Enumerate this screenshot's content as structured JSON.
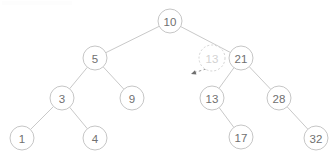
{
  "diagram": {
    "type": "binary-search-tree",
    "colors": {
      "background": "#ffffff",
      "node_stroke": "#c6c6c6",
      "node_fill": "#ffffff",
      "label_text": "#707070",
      "edge_stroke": "#c9c9c9",
      "ghost_stroke": "#d4d4d4",
      "ghost_text": "#d2d2d2",
      "arrow_stroke": "#9a9a9a"
    },
    "node_radius": 12,
    "ghost_node_radius": 13,
    "nodes": [
      {
        "id": "n10",
        "label": "10",
        "x": 170,
        "y": 21,
        "ghost": false
      },
      {
        "id": "n5",
        "label": "5",
        "x": 95,
        "y": 58,
        "ghost": false
      },
      {
        "id": "n21",
        "label": "21",
        "x": 241,
        "y": 58,
        "ghost": false
      },
      {
        "id": "n3",
        "label": "3",
        "x": 62,
        "y": 98,
        "ghost": false
      },
      {
        "id": "n9",
        "label": "9",
        "x": 132,
        "y": 98,
        "ghost": false
      },
      {
        "id": "n13",
        "label": "13",
        "x": 212,
        "y": 98,
        "ghost": false
      },
      {
        "id": "n28",
        "label": "28",
        "x": 279,
        "y": 98,
        "ghost": false
      },
      {
        "id": "n1",
        "label": "1",
        "x": 22,
        "y": 138,
        "ghost": false
      },
      {
        "id": "n4",
        "label": "4",
        "x": 95,
        "y": 138,
        "ghost": false
      },
      {
        "id": "n17",
        "label": "17",
        "x": 241,
        "y": 137,
        "ghost": false
      },
      {
        "id": "n32",
        "label": "32",
        "x": 316,
        "y": 138,
        "ghost": false
      },
      {
        "id": "nghost13",
        "label": "13",
        "x": 212,
        "y": 58,
        "ghost": true
      }
    ],
    "edges": [
      {
        "from": "n10",
        "to": "n5"
      },
      {
        "from": "n10",
        "to": "n21"
      },
      {
        "from": "n5",
        "to": "n3"
      },
      {
        "from": "n5",
        "to": "n9"
      },
      {
        "from": "n3",
        "to": "n1"
      },
      {
        "from": "n3",
        "to": "n4"
      },
      {
        "from": "n21",
        "to": "n13"
      },
      {
        "from": "n21",
        "to": "n28"
      },
      {
        "from": "n13",
        "to": "n17"
      },
      {
        "from": "n28",
        "to": "n32"
      }
    ],
    "annotation_arrow": {
      "name": "insertion-pointer-arrow",
      "from_x": 206,
      "from_y": 69,
      "to_x": 191,
      "to_y": 74,
      "style": "dashed"
    }
  }
}
